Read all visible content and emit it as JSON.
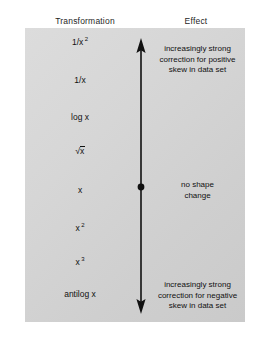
{
  "headers": {
    "left": "Transformation",
    "right": "Effect"
  },
  "transformations": [
    {
      "id": "recip-square",
      "base": "1/x",
      "sup": "2",
      "y": 36,
      "type": "sup"
    },
    {
      "id": "reciprocal",
      "base": "1/x",
      "sup": "",
      "y": 76,
      "type": "plain"
    },
    {
      "id": "log",
      "base": "log x",
      "sup": "",
      "y": 113,
      "type": "plain"
    },
    {
      "id": "square-root",
      "base": "x",
      "sup": "",
      "y": 146,
      "type": "sqrt"
    },
    {
      "id": "identity",
      "base": "x",
      "sup": "",
      "y": 186,
      "type": "plain"
    },
    {
      "id": "square",
      "base": "x",
      "sup": "2",
      "y": 222,
      "type": "sup"
    },
    {
      "id": "cube",
      "base": "x",
      "sup": "3",
      "y": 256,
      "type": "sup"
    },
    {
      "id": "antilog",
      "base": "antilog x",
      "sup": "",
      "y": 290,
      "type": "plain"
    }
  ],
  "effects": [
    {
      "id": "positive-skew",
      "y": 44,
      "lines": [
        "increasingly strong",
        "correction for positive",
        "skew in data set"
      ]
    },
    {
      "id": "no-change",
      "y": 180,
      "lines": [
        "no shape",
        "change"
      ]
    },
    {
      "id": "negative-skew",
      "y": 280,
      "lines": [
        "increasingly strong",
        "correction for negative",
        "skew in data set"
      ]
    }
  ],
  "axis": {
    "name": "double-headed-vertical-arrow",
    "top_arrow": "up",
    "bottom_arrow": "down",
    "midpoint_marker": "filled-dot",
    "color": "#111111"
  },
  "colors": {
    "canvas": "#ffffff",
    "panel": "#d6d6d6",
    "text": "#111111",
    "arrow": "#111111"
  }
}
